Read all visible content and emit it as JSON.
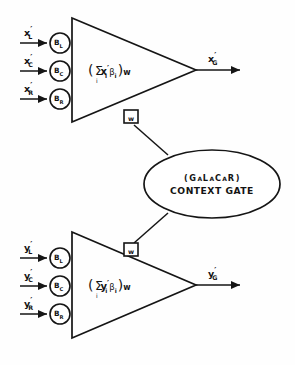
{
  "figure": {
    "type": "neural-network-schematic",
    "background_color": "#fefefe",
    "stroke_color": "#151515"
  },
  "units": [
    {
      "id": "upper-unit",
      "variable": "x",
      "prime": "′",
      "inputs": [
        {
          "label": "x",
          "prime": "′",
          "subscript": "L",
          "weight_label": "B",
          "weight_subscript": "L"
        },
        {
          "label": "x",
          "prime": "′",
          "subscript": "C",
          "weight_label": "B",
          "weight_subscript": "C"
        },
        {
          "label": "x",
          "prime": "′",
          "subscript": "R",
          "weight_label": "B",
          "weight_subscript": "R"
        }
      ],
      "formula": {
        "open_paren": "(",
        "sigma": "Σ",
        "index": "i",
        "variable": "x",
        "prime": "′",
        "var_subscript": "i",
        "beta": "β",
        "beta_subscript": "i",
        "close_paren": ")",
        "gain": "w",
        "plain": "( Σi x′i βi )w"
      },
      "output": {
        "label": "x",
        "prime": "′",
        "subscript": "G"
      },
      "gate_port": {
        "label": "w",
        "position": "lower-edge"
      }
    },
    {
      "id": "lower-unit",
      "variable": "y",
      "prime": "′",
      "inputs": [
        {
          "label": "y",
          "prime": "′",
          "subscript": "L",
          "weight_label": "B",
          "weight_subscript": "L"
        },
        {
          "label": "y",
          "prime": "′",
          "subscript": "C",
          "weight_label": "B",
          "weight_subscript": "C"
        },
        {
          "label": "y",
          "prime": "′",
          "subscript": "R",
          "weight_label": "B",
          "weight_subscript": "R"
        }
      ],
      "formula": {
        "open_paren": "(",
        "sigma": "Σ",
        "index": "i",
        "variable": "y",
        "prime": "′",
        "var_subscript": "i",
        "beta": "β",
        "beta_subscript": "i",
        "close_paren": ")",
        "gain": "w",
        "plain": "( Σi y′i βi )w"
      },
      "output": {
        "label": "y",
        "prime": "′",
        "subscript": "G"
      },
      "gate_port": {
        "label": "w",
        "position": "upper-edge"
      }
    }
  ],
  "gate": {
    "id": "context-gate",
    "acronym_open": "(",
    "acronym_parts": [
      {
        "text": "G",
        "size": "large"
      },
      {
        "text": "A",
        "size": "small"
      },
      {
        "text": "L",
        "size": "large"
      },
      {
        "text": "A",
        "size": "small"
      },
      {
        "text": "C",
        "size": "large"
      },
      {
        "text": "A",
        "size": "small"
      },
      {
        "text": "R",
        "size": "large"
      }
    ],
    "acronym_close": ")",
    "acronym_plain": "(GALACAR)",
    "label": "CONTEXT GATE"
  }
}
